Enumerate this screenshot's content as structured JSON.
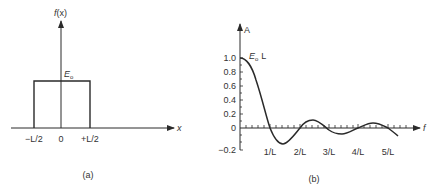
{
  "panel_a": {
    "caption": "(a)",
    "y_axis_label": "f(x)",
    "x_axis_label": "x",
    "amplitude_label": "E",
    "amplitude_subscript": "o",
    "x_ticks": [
      "−L/2",
      "0",
      "+L/2"
    ]
  },
  "panel_b": {
    "caption": "(b)",
    "y_axis_label": "A",
    "x_axis_label": "f",
    "peak_label": "E",
    "peak_subscript": "o",
    "peak_suffix": "L",
    "y_ticks": [
      "1.0",
      "0.8",
      "0.6",
      "0.4",
      "0.2",
      "0",
      "−0.2"
    ],
    "x_ticks": [
      "1/L",
      "2/L",
      "3/L",
      "4/L",
      "5/L"
    ]
  },
  "colors": {
    "line": "#2a2a2a",
    "background": "#ffffff"
  }
}
